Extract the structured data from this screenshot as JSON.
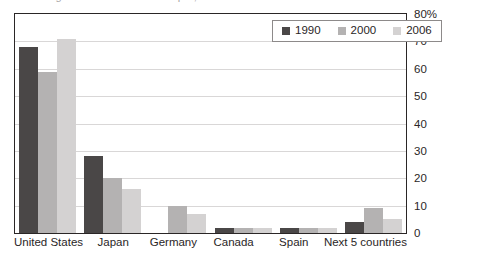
{
  "title_sliver": "Figure: Share of world output, selected economies",
  "legend": {
    "position": "top-right-inside",
    "entries": [
      {
        "label": "1990",
        "color": "#4a4747",
        "swatch": "legend-swatch-1990"
      },
      {
        "label": "2000",
        "color": "#b4b2b2",
        "swatch": "legend-swatch-2000"
      },
      {
        "label": "2006",
        "color": "#d4d2d2",
        "swatch": "legend-swatch-2006"
      }
    ]
  },
  "axis": {
    "y_ticks": [
      "80%",
      "70",
      "60",
      "50",
      "40",
      "30",
      "20",
      "10",
      "0"
    ],
    "y_values": [
      80,
      70,
      60,
      50,
      40,
      30,
      20,
      10,
      0
    ]
  },
  "chart_data": {
    "type": "bar",
    "title": "",
    "xlabel": "",
    "ylabel": "",
    "ylim": [
      0,
      80
    ],
    "grid": true,
    "legend_position": "top right",
    "categories": [
      "United States",
      "Japan",
      "Germany",
      "Canada",
      "Spain",
      "Next 5 countries"
    ],
    "series": [
      {
        "name": "1990",
        "color": "#4a4747",
        "values": [
          68,
          28,
          0,
          2,
          2,
          4
        ]
      },
      {
        "name": "2000",
        "color": "#b4b2b2",
        "values": [
          59,
          20,
          10,
          2,
          2,
          9
        ]
      },
      {
        "name": "2006",
        "color": "#d4d2d2",
        "values": [
          71,
          16,
          7,
          2,
          2,
          5
        ]
      }
    ]
  }
}
